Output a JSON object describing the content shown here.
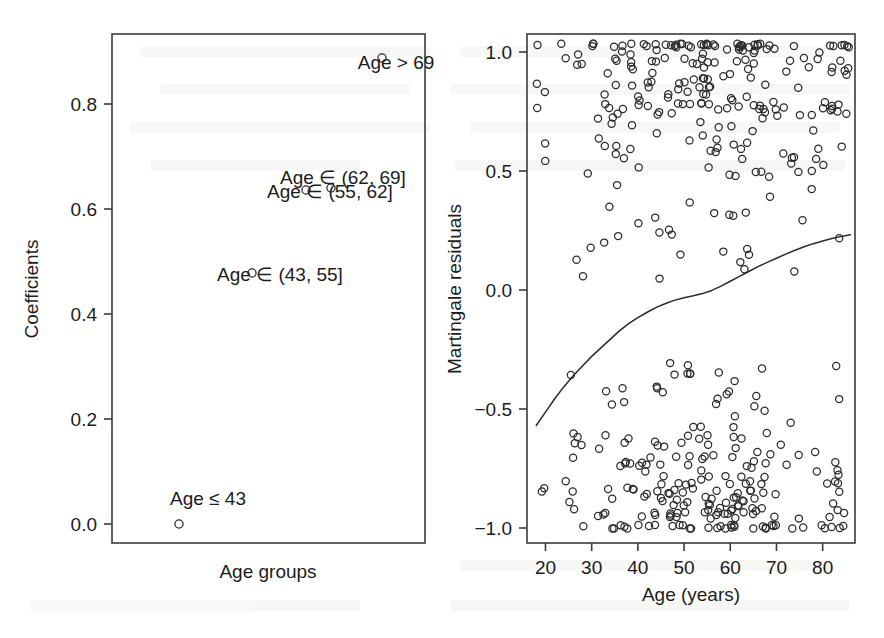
{
  "figure": {
    "background": "#ffffff",
    "ink_color": "#2b2b2b",
    "panels": [
      "coefficients-panel",
      "martingale-panel"
    ]
  },
  "left_panel": {
    "plot_box": {
      "x": 112,
      "y": 34,
      "width": 313,
      "height": 509
    },
    "xlabel": "Age groups",
    "ylabel": "Coefficients",
    "y_ticks": [
      "0.0",
      "0.2",
      "0.4",
      "0.6",
      "0.8"
    ],
    "y_tick_values": [
      0.0,
      0.2,
      0.4,
      0.6,
      0.8
    ],
    "labels": [
      {
        "text": "Age ≤ 43",
        "x": 208,
        "y": 505,
        "anchor": "middle",
        "point_x": 179,
        "point_y": 524
      },
      {
        "text": "Age ∈ (43, 55]",
        "x": 280,
        "y": 281,
        "anchor": "middle",
        "point_x": 252,
        "point_y": 273
      },
      {
        "text": "Age ∈ (55, 62]",
        "x": 330,
        "y": 198,
        "anchor": "middle",
        "point_x": 331,
        "point_y": 188
      },
      {
        "text": "Age ∈ (62, 69]",
        "x": 343,
        "y": 184,
        "anchor": "middle",
        "point_x": 306,
        "point_y": 190
      },
      {
        "text": "Age > 69",
        "x": 396,
        "y": 69,
        "anchor": "middle",
        "point_x": 382,
        "point_y": 58
      }
    ]
  },
  "right_panel": {
    "plot_box": {
      "x": 527,
      "y": 34,
      "width": 328,
      "height": 509
    },
    "xlabel": "Age (years)",
    "ylabel": "Martingale residuals",
    "x_ticks": [
      "20",
      "30",
      "40",
      "50",
      "60",
      "70",
      "80"
    ],
    "x_tick_values": [
      20,
      30,
      40,
      50,
      60,
      70,
      80
    ],
    "y_ticks": [
      "1.0",
      "0.5",
      "0.0",
      "−0.5",
      "−1.0"
    ],
    "y_tick_values": [
      1.0,
      0.5,
      0.0,
      -0.5,
      -1.0
    ]
  },
  "chart_data": [
    {
      "type": "scatter",
      "title": "",
      "xlabel": "Age groups",
      "ylabel": "Coefficients",
      "ylim": [
        -0.03,
        0.9
      ],
      "xlim": [
        0,
        6
      ],
      "grid": false,
      "legend": "none",
      "categories": [
        "Age ≤ 43",
        "Age ∈ (43, 55]",
        "Age ∈ (55, 62]",
        "Age ∈ (62, 69]",
        "Age > 69"
      ],
      "values": [
        0.0,
        0.465,
        0.6,
        0.59,
        0.885
      ],
      "x": [
        1,
        2,
        3,
        4,
        5
      ],
      "annotations": [
        "Age ≤ 43",
        "Age ∈ (43, 55]",
        "Age ∈ (55, 62]",
        "Age ∈ (62, 69]",
        "Age > 69"
      ]
    },
    {
      "type": "scatter",
      "title": "",
      "xlabel": "Age (years)",
      "ylabel": "Martingale residuals",
      "xlim": [
        16,
        87
      ],
      "ylim": [
        -1.06,
        1.04
      ],
      "grid": false,
      "legend": "none",
      "series": [
        {
          "name": "martingale residuals",
          "x": [
            19.0,
            22.5,
            25.5,
            28.0,
            30.5,
            31.5,
            32.0,
            33.0,
            33.5,
            34.0,
            34.5,
            35.0,
            35.5,
            36.0,
            36.5,
            37.0,
            37.5,
            38.0,
            38.5,
            39.0,
            39.5,
            40.0,
            40.5,
            41.0,
            41.5,
            42.0,
            42.5,
            43.0,
            43.5,
            44.0,
            44.5,
            45.0,
            45.5,
            46.0,
            46.5,
            47.0,
            47.5,
            48.0,
            48.5,
            49.0,
            49.5,
            50.0,
            50.5,
            51.0,
            51.5,
            52.0,
            52.5,
            53.0,
            53.5,
            54.0,
            54.5,
            55.0,
            55.5,
            56.0,
            56.5,
            57.0,
            57.5,
            58.0,
            58.5,
            59.0,
            59.5,
            60.0,
            60.5,
            61.0,
            61.5,
            62.0,
            62.5,
            63.0,
            63.5,
            64.0,
            64.5,
            65.0,
            65.5,
            66.0,
            66.5,
            67.0,
            67.5,
            68.0,
            68.5,
            69.0,
            69.5,
            70.0,
            70.5,
            71.0,
            71.5,
            72.0,
            72.5,
            73.0,
            73.5,
            74.0,
            74.5,
            75.0,
            76.0,
            77.0,
            78.0,
            79.0,
            80.5,
            82.0,
            84.0,
            85.5
          ],
          "y": [
            0.92,
            0.93,
            0.9,
            0.95,
            0.88,
            0.96,
            0.8,
            0.72,
            0.6,
            0.98,
            0.85,
            0.55,
            0.7,
            0.92,
            0.62,
            0.78,
            0.88,
            0.4,
            0.95,
            0.68,
            0.82,
            0.5,
            0.74,
            0.9,
            0.33,
            0.65,
            0.97,
            0.58,
            0.8,
            0.44,
            0.92,
            0.71,
            0.86,
            0.25,
            0.6,
            0.95,
            0.52,
            0.78,
            0.88,
            0.38,
            0.66,
            0.99,
            0.57,
            0.83,
            0.45,
            0.91,
            0.7,
            0.28,
            0.75,
            0.94,
            0.61,
            0.86,
            0.48,
            0.97,
            0.73,
            0.55,
            0.89,
            0.66,
            0.99,
            0.42,
            0.8,
            0.93,
            0.58,
            0.72,
            0.96,
            0.63,
            0.85,
            0.5,
            0.98,
            0.76,
            0.68,
            0.9,
            0.56,
            0.99,
            0.81,
            0.64,
            0.93,
            0.47,
            0.87,
            0.99,
            0.71,
            0.59,
            0.95,
            0.78,
            0.66,
            0.99,
            0.84,
            0.53,
            0.92,
            0.99,
            0.74,
            0.61,
            0.88,
            0.99,
            0.69,
            0.95,
            0.77,
            0.99,
            0.93,
            0.7
          ]
        },
        {
          "name": "lowess smooth",
          "x": [
            18.0,
            20.0,
            22.0,
            24.0,
            26.0,
            28.0,
            30.0,
            32.0,
            34.0,
            36.0,
            38.0,
            40.0,
            42.0,
            44.0,
            46.0,
            48.0,
            50.0,
            52.0,
            54.0,
            56.0,
            58.0,
            60.0,
            62.0,
            64.0,
            66.0,
            68.0,
            70.0,
            72.0,
            74.0,
            76.0,
            78.0,
            80.0,
            82.0,
            84.0,
            86.0
          ],
          "y": [
            -0.575,
            -0.52,
            -0.465,
            -0.415,
            -0.37,
            -0.33,
            -0.29,
            -0.255,
            -0.22,
            -0.185,
            -0.155,
            -0.13,
            -0.108,
            -0.088,
            -0.072,
            -0.058,
            -0.048,
            -0.04,
            -0.031,
            -0.018,
            0.0,
            0.02,
            0.04,
            0.06,
            0.08,
            0.098,
            0.115,
            0.132,
            0.148,
            0.162,
            0.175,
            0.186,
            0.196,
            0.205,
            0.212
          ]
        }
      ]
    }
  ]
}
